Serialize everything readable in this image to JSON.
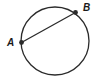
{
  "figure": {
    "background_color": "#ffffff",
    "stroke_color": "#2b2b2b",
    "label_color": "#1a1a1a",
    "stroke_width": 1.3,
    "dot_radius": 2.4,
    "circle": {
      "cx": 55,
      "cy": 41,
      "r": 34
    },
    "chord": {
      "x1": 21.5,
      "y1": 42.5,
      "x2": 75.5,
      "y2": 12.5
    },
    "points": [
      {
        "label": "A",
        "x": 21.5,
        "y": 42.5,
        "label_x": 7,
        "label_y": 46
      },
      {
        "label": "B",
        "x": 75.5,
        "y": 12.5,
        "label_x": 83,
        "label_y": 11
      }
    ]
  }
}
